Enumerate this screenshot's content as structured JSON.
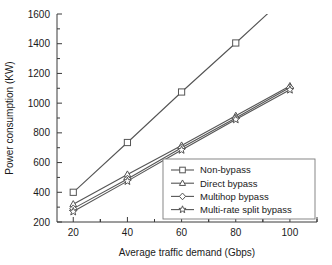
{
  "chart_data": {
    "type": "line",
    "title": "",
    "xlabel": "Average traffic demand (Gbps)",
    "ylabel": "Power consumption (KW)",
    "x": [
      20,
      40,
      60,
      80,
      100
    ],
    "xlim": [
      14,
      110
    ],
    "ylim": [
      200,
      1600
    ],
    "xticks": [
      20,
      40,
      60,
      80,
      100
    ],
    "xticklabels": [
      "20",
      "40",
      "60",
      "80",
      "100"
    ],
    "yticks": [
      200,
      400,
      600,
      800,
      1000,
      1200,
      1400,
      1600
    ],
    "yticklabels": [
      "200",
      "400",
      "600",
      "800",
      "1000",
      "1200",
      "1400",
      "1600"
    ],
    "minor_ticks": true,
    "grid": false,
    "legend_position": "lower right",
    "series": [
      {
        "name": "Non-bypass",
        "marker": "square",
        "color": "#555555",
        "values": [
          400,
          735,
          1075,
          1405,
          1740
        ]
      },
      {
        "name": "Direct bypass",
        "marker": "triangle",
        "color": "#555555",
        "values": [
          320,
          520,
          715,
          915,
          1115
        ]
      },
      {
        "name": "Multihop bypass",
        "marker": "diamond",
        "color": "#555555",
        "values": [
          290,
          490,
          700,
          900,
          1105
        ]
      },
      {
        "name": "Multi-rate split bypass",
        "marker": "star",
        "color": "#555555",
        "values": [
          270,
          475,
          685,
          890,
          1090
        ]
      }
    ]
  },
  "legend": {
    "entries": [
      {
        "label": "Non-bypass"
      },
      {
        "label": "Direct bypass"
      },
      {
        "label": "Multihop bypass"
      },
      {
        "label": "Multi-rate split bypass"
      }
    ]
  }
}
